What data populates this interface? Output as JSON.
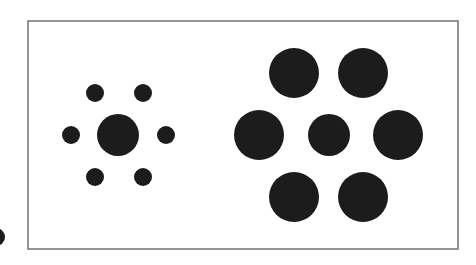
{
  "figure": {
    "colors": {
      "background": "#ffffff",
      "frame": "#7a7a7a",
      "circle_fill": "#1c1c1c"
    },
    "frame": {
      "x": 28,
      "y": 21,
      "width": 430,
      "height": 228
    },
    "left_cluster": {
      "center": {
        "cx": 118,
        "cy": 135,
        "r": 21
      },
      "surround": [
        {
          "cx": 95,
          "cy": 93,
          "r": 9
        },
        {
          "cx": 143,
          "cy": 93,
          "r": 9
        },
        {
          "cx": 71,
          "cy": 135,
          "r": 9
        },
        {
          "cx": 166,
          "cy": 135,
          "r": 9
        },
        {
          "cx": 95,
          "cy": 177,
          "r": 9
        },
        {
          "cx": 143,
          "cy": 177,
          "r": 9
        }
      ]
    },
    "right_cluster": {
      "center": {
        "cx": 329,
        "cy": 135,
        "r": 21
      },
      "surround": [
        {
          "cx": 294,
          "cy": 73,
          "r": 25
        },
        {
          "cx": 363,
          "cy": 73,
          "r": 25
        },
        {
          "cx": 259,
          "cy": 135,
          "r": 25
        },
        {
          "cx": 398,
          "cy": 135,
          "r": 25
        },
        {
          "cx": 294,
          "cy": 197,
          "r": 25
        },
        {
          "cx": 363,
          "cy": 197,
          "r": 25
        }
      ]
    },
    "edge_fragment": {
      "cx": -4,
      "cy": 237,
      "r": 9
    }
  }
}
